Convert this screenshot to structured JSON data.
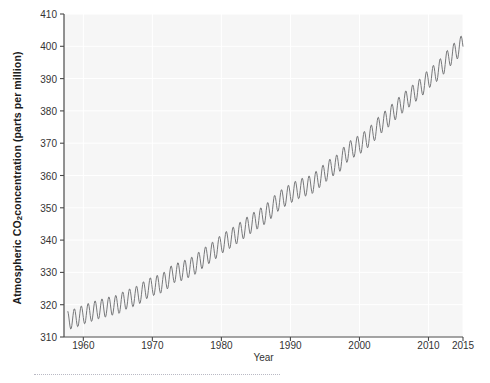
{
  "chart_data": {
    "type": "line",
    "title": "",
    "subtitle": "",
    "xlabel": "Year",
    "ylabel": "Atmospheric CO2 concentration (parts per million)",
    "ylabel_parts": {
      "pre": "Atmospheric  CO",
      "sub": "2",
      "post": " concentration (parts per million)"
    },
    "xlim": [
      1957.2,
      2015.0
    ],
    "ylim": [
      310,
      410
    ],
    "xticks": [
      1960,
      1970,
      1980,
      1990,
      2000,
      2010,
      2015
    ],
    "xtick_labels": [
      "1960",
      "1970",
      "1980",
      "1990",
      "2000",
      "2010",
      "2015"
    ],
    "yticks": [
      310,
      320,
      330,
      340,
      350,
      360,
      370,
      380,
      390,
      400,
      410
    ],
    "ytick_labels": [
      "310",
      "320",
      "330",
      "340",
      "350",
      "360",
      "370",
      "380",
      "390",
      "400",
      "410"
    ],
    "grid": true,
    "grid_color": "#ffffff",
    "plot_background": "#f6f6f6",
    "legend": null,
    "line_color": "#77787a",
    "line_width": 1.0,
    "series": [
      {
        "name": "Mauna Loa monthly mean CO2",
        "description": "Seasonally oscillating monthly CO2 record (Keeling Curve) rising from ~315 ppm in 1958 to ~401 ppm in 2015",
        "seasonal_amplitude_ppm": 3.0,
        "annual_mean_x": [
          1958,
          1959,
          1960,
          1961,
          1962,
          1963,
          1964,
          1965,
          1966,
          1967,
          1968,
          1969,
          1970,
          1971,
          1972,
          1973,
          1974,
          1975,
          1976,
          1977,
          1978,
          1979,
          1980,
          1981,
          1982,
          1983,
          1984,
          1985,
          1986,
          1987,
          1988,
          1989,
          1990,
          1991,
          1992,
          1993,
          1994,
          1995,
          1996,
          1997,
          1998,
          1999,
          2000,
          2001,
          2002,
          2003,
          2004,
          2005,
          2006,
          2007,
          2008,
          2009,
          2010,
          2011,
          2012,
          2013,
          2014,
          2015
        ],
        "annual_mean_y": [
          315.3,
          315.98,
          316.91,
          317.64,
          318.45,
          318.99,
          319.62,
          320.04,
          321.38,
          322.16,
          323.04,
          324.62,
          325.68,
          326.32,
          327.45,
          329.68,
          330.18,
          331.11,
          332.04,
          333.83,
          335.4,
          336.84,
          338.75,
          340.11,
          341.45,
          343.05,
          344.65,
          346.12,
          347.42,
          349.19,
          351.57,
          353.12,
          354.39,
          355.61,
          356.45,
          357.1,
          358.83,
          360.82,
          362.61,
          363.73,
          366.7,
          368.38,
          369.55,
          371.14,
          373.28,
          375.8,
          377.52,
          379.8,
          381.9,
          383.79,
          385.6,
          387.43,
          389.9,
          391.65,
          393.85,
          396.52,
          398.65,
          400.83
        ]
      }
    ]
  },
  "axes": {
    "axis_color": "#4a4a4a",
    "text_color": "#333333",
    "label_color": "#1a1a1a"
  },
  "footer": {
    "rule": "dotted-separator"
  }
}
